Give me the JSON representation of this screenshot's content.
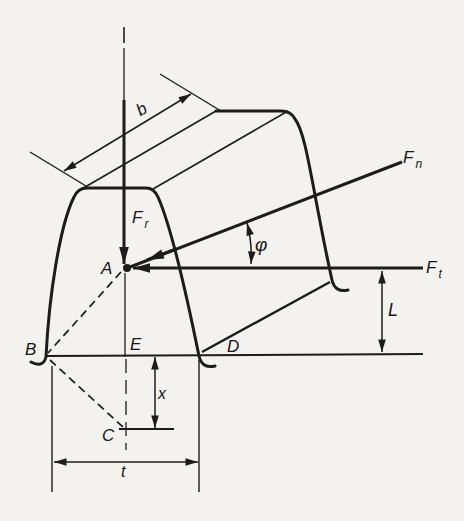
{
  "figure": {
    "background": "#f3f2ee",
    "ink": "#1c1c1c",
    "points": {
      "A": "A",
      "B": "B",
      "C": "C",
      "D": "D",
      "E": "E"
    },
    "forces": {
      "radial": {
        "base": "F",
        "sub": "r"
      },
      "normal": {
        "base": "F",
        "sub": "n"
      },
      "tangential": {
        "base": "F",
        "sub": "t"
      }
    },
    "angles": {
      "pressure_angle": "φ"
    },
    "dimensions": {
      "face_width": "b",
      "moment_arm": "L",
      "root_offset": "x",
      "root_thickness": "t"
    }
  }
}
